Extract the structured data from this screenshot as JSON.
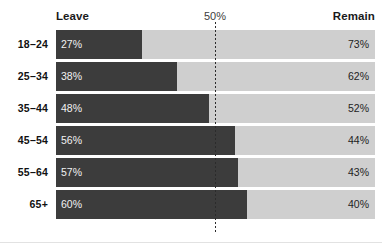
{
  "header": {
    "left_label": "Leave",
    "mid_label": "50%",
    "right_label": "Remain"
  },
  "axis": {
    "midline_value": "50%"
  },
  "footer": {
    "rule": ""
  },
  "colors": {
    "leave": "#3c3c3c",
    "remain": "#cfcfcf",
    "background": "#ffffff",
    "midline": "#2b2b2b",
    "leave_text": "#f2f2f2",
    "remain_text": "#232323"
  },
  "rows": [
    {
      "category": "18–24",
      "leave": 27,
      "remain": 73,
      "leave_label": "27%",
      "remain_label": "73%"
    },
    {
      "category": "25–34",
      "leave": 38,
      "remain": 62,
      "leave_label": "38%",
      "remain_label": "62%"
    },
    {
      "category": "35–44",
      "leave": 48,
      "remain": 52,
      "leave_label": "48%",
      "remain_label": "52%"
    },
    {
      "category": "45–54",
      "leave": 56,
      "remain": 44,
      "leave_label": "56%",
      "remain_label": "44%"
    },
    {
      "category": "55–64",
      "leave": 57,
      "remain": 43,
      "leave_label": "57%",
      "remain_label": "43%"
    },
    {
      "category": "65+",
      "leave": 60,
      "remain": 40,
      "leave_label": "60%",
      "remain_label": "40%"
    }
  ],
  "chart_data": {
    "type": "bar",
    "orientation": "horizontal",
    "stacked": true,
    "normalized": true,
    "title": "",
    "subtitle": "",
    "xlabel": "",
    "ylabel": "",
    "xlim": [
      0,
      100
    ],
    "grid": false,
    "legend_position": "top",
    "categories": [
      "18–24",
      "25–34",
      "35–44",
      "45–54",
      "55–64",
      "65+"
    ],
    "series": [
      {
        "name": "Leave",
        "values": [
          27,
          38,
          48,
          56,
          57,
          60
        ],
        "color": "#3c3c3c"
      },
      {
        "name": "Remain",
        "values": [
          73,
          62,
          52,
          44,
          43,
          40
        ],
        "color": "#cfcfcf"
      }
    ],
    "annotations": [
      {
        "type": "reference-line",
        "axis": "x",
        "value": 50,
        "label": "50%",
        "style": "dotted"
      }
    ],
    "tick_labels": {
      "x": [
        "50%"
      ],
      "y": [
        "18–24",
        "25–34",
        "35–44",
        "45–54",
        "55–64",
        "65+"
      ]
    },
    "data_labels": [
      {
        "category": "18–24",
        "Leave": "27%",
        "Remain": "73%"
      },
      {
        "category": "25–34",
        "Leave": "38%",
        "Remain": "62%"
      },
      {
        "category": "35–44",
        "Leave": "48%",
        "Remain": "52%"
      },
      {
        "category": "45–54",
        "Leave": "56%",
        "Remain": "44%"
      },
      {
        "category": "55–64",
        "Leave": "57%",
        "Remain": "43%"
      },
      {
        "category": "65+",
        "Leave": "60%",
        "Remain": "40%"
      }
    ]
  }
}
